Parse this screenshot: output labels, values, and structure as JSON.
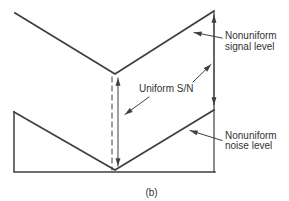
{
  "diagram": {
    "caption": "(b)",
    "labels": {
      "signal": {
        "line1": "Nonuniform",
        "line2": "signal level"
      },
      "sn": "Uniform S/N",
      "noise": {
        "line1": "Nonuniform",
        "line2": "noise level"
      }
    },
    "colors": {
      "line": "#3f3f3f",
      "text": "#333333",
      "background": "#ffffff"
    }
  }
}
